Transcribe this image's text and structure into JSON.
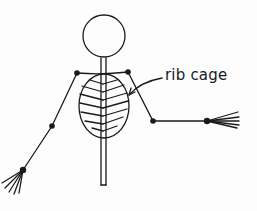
{
  "diagram": {
    "labels": {
      "rib_cage": "rib cage"
    },
    "colors": {
      "ink": "#1a1a1a",
      "background": "#fdfdfd"
    }
  }
}
